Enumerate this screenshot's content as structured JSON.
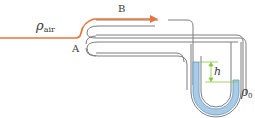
{
  "labels": {
    "air_density": "ρ",
    "air_density_sub": "air",
    "point_a": "A",
    "point_b": "B",
    "height": "h",
    "fluid_density": "ρ",
    "fluid_density_sub": "0"
  },
  "colors": {
    "flow_line": "#e8743b",
    "tube_wall": "#7d7d7d",
    "fluid_fill": "#a9cce6",
    "fluid_edge": "#5f95c0",
    "height_marker": "#8cc63f",
    "text": "#3a3a3a"
  }
}
